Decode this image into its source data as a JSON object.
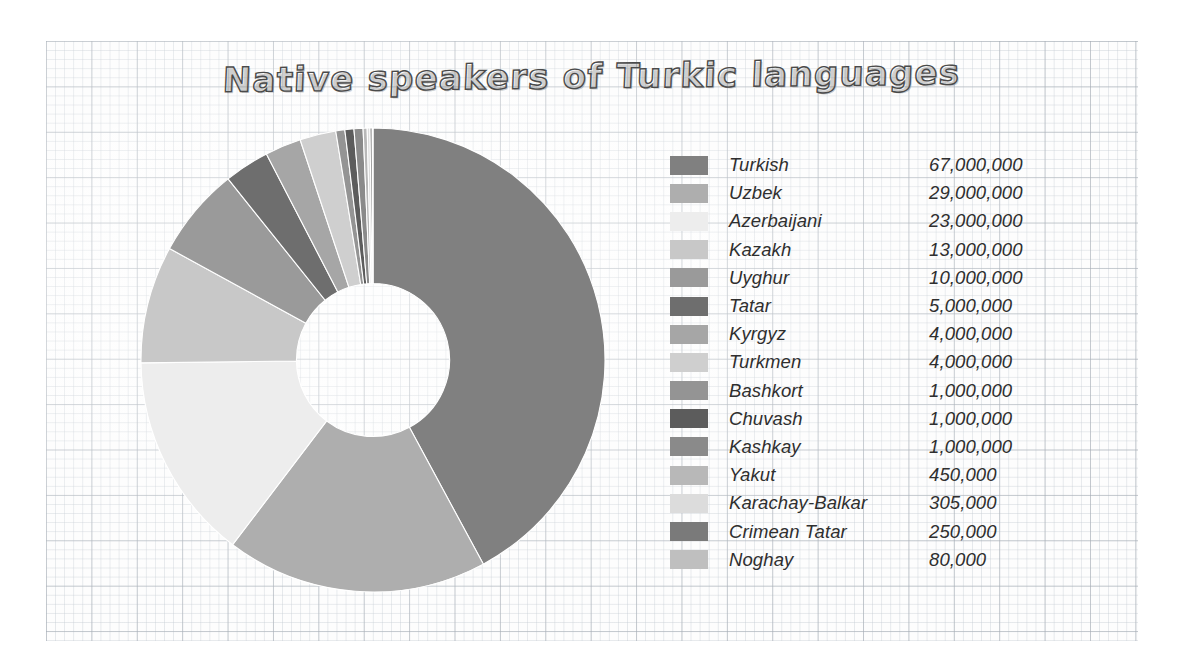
{
  "chart_data": {
    "type": "pie",
    "variant": "donut",
    "title": "Native speakers of Turkic languages",
    "xlabel": "",
    "ylabel": "",
    "legend_position": "right",
    "grid": true,
    "start_angle_deg": 0,
    "direction": "clockwise",
    "inner_radius_ratio": 0.33,
    "total": 158085000,
    "categories": [
      "Turkish",
      "Uzbek",
      "Azerbaijani",
      "Kazakh",
      "Uyghur",
      "Tatar",
      "Kyrgyz",
      "Turkmen",
      "Bashkort",
      "Chuvash",
      "Kashkay",
      "Yakut",
      "Karachay-Balkar",
      "Crimean Tatar",
      "Noghay"
    ],
    "values": [
      67000000,
      29000000,
      23000000,
      13000000,
      10000000,
      5000000,
      4000000,
      4000000,
      1000000,
      1000000,
      1000000,
      450000,
      305000,
      250000,
      80000
    ],
    "value_labels": [
      "67,000,000",
      "29,000,000",
      "23,000,000",
      "13,000,000",
      "10,000,000",
      "5,000,000",
      "4,000,000",
      "4,000,000",
      "1,000,000",
      "1,000,000",
      "1,000,000",
      "450,000",
      "305,000",
      "250,000",
      "80,000"
    ],
    "colors": [
      "#808080",
      "#aeaeae",
      "#ededed",
      "#c8c8c8",
      "#9a9a9a",
      "#6e6e6e",
      "#a6a6a6",
      "#cfcfcf",
      "#949494",
      "#5c5c5c",
      "#8a8a8a",
      "#b8b8b8",
      "#dcdcdc",
      "#7a7a7a",
      "#bfbfbf"
    ]
  },
  "legend": {
    "rows": [
      {
        "label": "Turkish",
        "value": "67,000,000",
        "color": "#808080"
      },
      {
        "label": "Uzbek",
        "value": "29,000,000",
        "color": "#aeaeae"
      },
      {
        "label": "Azerbaijani",
        "value": "23,000,000",
        "color": "#ededed"
      },
      {
        "label": "Kazakh",
        "value": "13,000,000",
        "color": "#c8c8c8"
      },
      {
        "label": "Uyghur",
        "value": "10,000,000",
        "color": "#9a9a9a"
      },
      {
        "label": "Tatar",
        "value": "5,000,000",
        "color": "#6e6e6e"
      },
      {
        "label": "Kyrgyz",
        "value": "4,000,000",
        "color": "#a6a6a6"
      },
      {
        "label": "Turkmen",
        "value": "4,000,000",
        "color": "#cfcfcf"
      },
      {
        "label": "Bashkort",
        "value": "1,000,000",
        "color": "#949494"
      },
      {
        "label": "Chuvash",
        "value": "1,000,000",
        "color": "#5c5c5c"
      },
      {
        "label": "Kashkay",
        "value": "1,000,000",
        "color": "#8a8a8a"
      },
      {
        "label": "Yakut",
        "value": "450,000",
        "color": "#b8b8b8"
      },
      {
        "label": "Karachay-Balkar",
        "value": "305,000",
        "color": "#dcdcdc"
      },
      {
        "label": "Crimean Tatar",
        "value": "250,000",
        "color": "#7a7a7a"
      },
      {
        "label": "Noghay",
        "value": "80,000",
        "color": "#bfbfbf"
      }
    ]
  },
  "theme": {
    "paper_background": "#fdfdfd",
    "grid_minor_color": "#c6cdd4",
    "grid_major_color": "#a5acb4",
    "text_color": "#2f2f2f",
    "title_outline_color": "#4a4a4a"
  }
}
